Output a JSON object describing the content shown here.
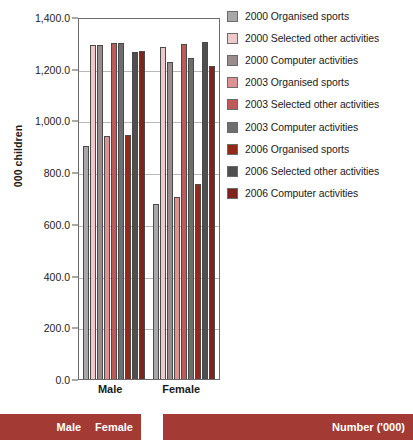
{
  "chart_data": {
    "type": "bar",
    "title": "",
    "xlabel": "",
    "ylabel": "000 children",
    "ylim": [
      0,
      1400
    ],
    "ytick_step": 200,
    "grid": true,
    "legend_position": "right",
    "categories": [
      "Male",
      "Female"
    ],
    "ytick_labels": [
      "1,400.0",
      "1,200.0",
      "1,000.0",
      "800.0",
      "600.0",
      "400.0",
      "200.0",
      "0.0"
    ],
    "ytick_values": [
      1400,
      1200,
      1000,
      800,
      600,
      400,
      200,
      0
    ],
    "series": [
      {
        "name": "2000 Organised sports",
        "color": "#a8a8a8",
        "values": [
          900,
          675
        ]
      },
      {
        "name": "2000 Selected other activities",
        "color": "#efc9c9",
        "values": [
          1290,
          1285
        ]
      },
      {
        "name": "2000 Computer activities",
        "color": "#9a8c8c",
        "values": [
          1290,
          1225
        ]
      },
      {
        "name": "2003 Organised sports",
        "color": "#dd9292",
        "values": [
          940,
          705
        ]
      },
      {
        "name": "2003 Selected other activities",
        "color": "#bb5c58",
        "values": [
          1300,
          1295
        ]
      },
      {
        "name": "2003 Computer activities",
        "color": "#6e6e6e",
        "values": [
          1300,
          1240
        ]
      },
      {
        "name": "2006 Organised sports",
        "color": "#96281b",
        "values": [
          945,
          755
        ]
      },
      {
        "name": "2006 Selected other activities",
        "color": "#4f4f4f",
        "values": [
          1265,
          1305
        ]
      },
      {
        "name": "2006 Computer activities",
        "color": "#7e241c",
        "values": [
          1270,
          1210
        ]
      }
    ]
  },
  "axis": {
    "y_title": "000 children"
  },
  "banners": {
    "left": {
      "items": [
        "Male",
        "Female"
      ]
    },
    "right": {
      "label": "Number ('000)"
    },
    "color": "#a33a33"
  }
}
